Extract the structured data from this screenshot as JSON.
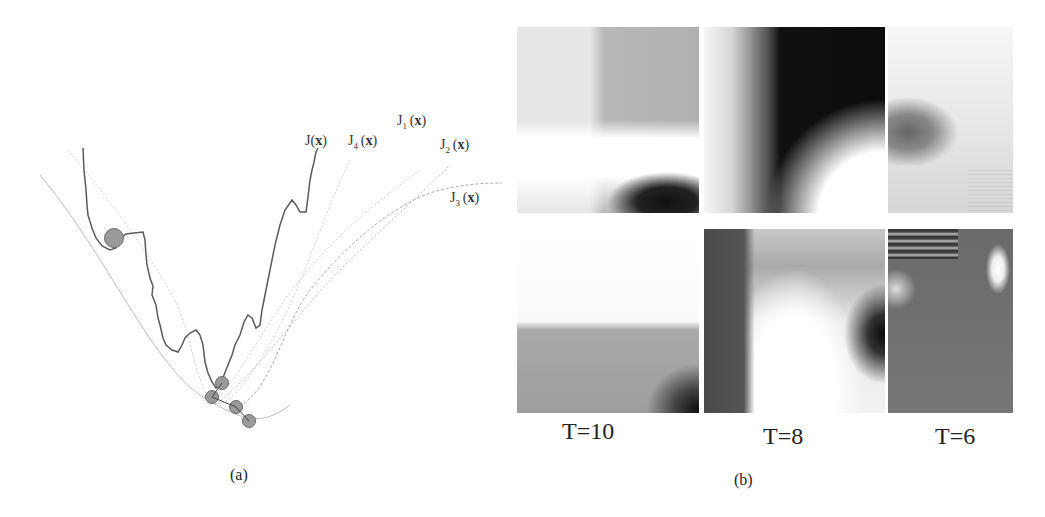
{
  "figure": {
    "panel_a": {
      "caption": "(a)",
      "labels": [
        {
          "id": "J",
          "base": "J",
          "sub": "",
          "arg": "x",
          "text": "J(x)"
        },
        {
          "id": "J4",
          "base": "J",
          "sub": "4",
          "arg": "x",
          "text": "J4(x)"
        },
        {
          "id": "J1",
          "base": "J",
          "sub": "1",
          "arg": "x",
          "text": "J1(x)"
        },
        {
          "id": "J2",
          "base": "J",
          "sub": "2",
          "arg": "x",
          "text": "J2(x)"
        },
        {
          "id": "J3",
          "base": "J",
          "sub": "3",
          "arg": "x",
          "text": "J3(x)"
        }
      ],
      "description": "Noisy objective J(x) with smoothed surrogate curves J1..J4; gray balls mark successive minima positions descending toward the global minimum."
    },
    "panel_b": {
      "caption": "(b)",
      "columns": [
        {
          "label": "T=10"
        },
        {
          "label": "T=8"
        },
        {
          "label": "T=6"
        }
      ],
      "rows": 2
    }
  },
  "colors": {
    "curve_main": "#555555",
    "curve_smooth": "#b0b0b0",
    "ball_fill": "#9a9a9a",
    "ball_stroke": "#6a6a6a"
  }
}
